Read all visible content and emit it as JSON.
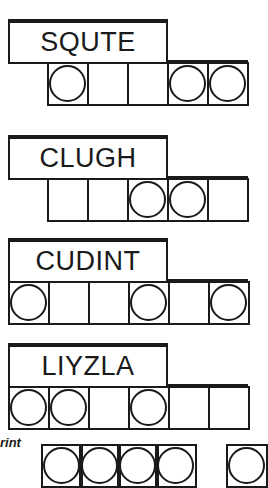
{
  "puzzles": [
    {
      "scrambled": "SQUTE",
      "slots": [
        true,
        false,
        false,
        true,
        true
      ]
    },
    {
      "scrambled": "CLUGH",
      "slots": [
        false,
        false,
        true,
        true,
        false
      ]
    },
    {
      "scrambled": "CUDINT",
      "slots": [
        true,
        false,
        false,
        true,
        false,
        true
      ]
    },
    {
      "scrambled": "LIYZLA",
      "slots": [
        true,
        true,
        false,
        true,
        false,
        false
      ]
    }
  ],
  "answer_area": {
    "label": "rint",
    "slots_group_1": [
      true,
      true,
      true,
      true
    ],
    "slots_group_2": [
      true
    ]
  }
}
